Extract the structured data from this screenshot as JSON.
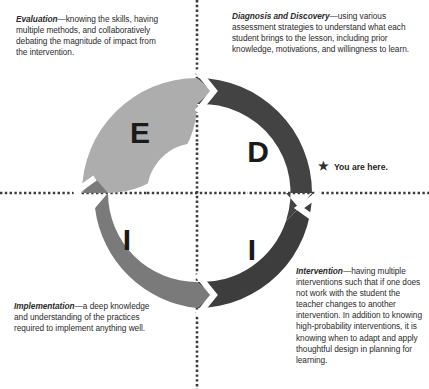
{
  "diagram": {
    "center": {
      "x": 197,
      "y": 193
    },
    "outer_radius": 115,
    "inner_radius": 50,
    "segments": [
      {
        "key": "evaluation",
        "letter": "E",
        "label": "Evaluation",
        "color": "#adadad",
        "position": "top-left"
      },
      {
        "key": "diagnosis",
        "letter": "D",
        "label": "Diagnosis and Discovery",
        "color": "#434343",
        "position": "top-right"
      },
      {
        "key": "intervention",
        "letter": "I",
        "label": "Intervention",
        "color": "#3d3d3d",
        "position": "bottom-right"
      },
      {
        "key": "implementation",
        "letter": "I",
        "label": "Implementation",
        "color": "#7a7a7a",
        "position": "bottom-left"
      }
    ],
    "separator_color": "#ffffff",
    "crosshair_color": "#3c3c3c"
  },
  "notes": {
    "evaluation": {
      "lead": "Evaluation",
      "body": "—knowing the skills, having multiple methods, and collaboratively debating the magnitude of impact from the intervention."
    },
    "diagnosis": {
      "lead": "Diagnosis and Discovery",
      "body": "—using various assessment strategies to understand what each student brings to the lesson, including prior knowledge, motivations, and willingness to learn."
    },
    "implementation": {
      "lead": "Implementation",
      "body": "—a deep knowledge and understanding of the practices required to implement anything well."
    },
    "intervention": {
      "lead": "Intervention",
      "body": "—having multiple interventions such that if one does not work with the student the teacher changes to another intervention. In addition to knowing high-probability interventions, it is knowing when to adapt and apply thoughtful design in planning for learning."
    }
  },
  "marker": {
    "icon": "star-icon",
    "glyph": "★",
    "label": "You are here."
  }
}
